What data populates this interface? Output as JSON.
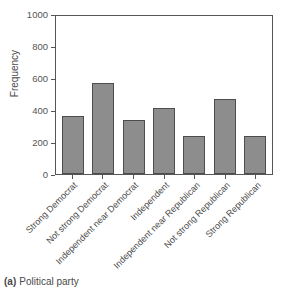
{
  "caption": {
    "tag": "(a)",
    "text": "Political party"
  },
  "chart_data": {
    "type": "bar",
    "title": "",
    "subtitle": "",
    "xlabel": "",
    "ylabel": "Frequency",
    "ylim": [
      0,
      1000
    ],
    "yticks": [
      0,
      200,
      400,
      600,
      800,
      1000
    ],
    "ytick_labels": [
      "0",
      "200",
      "400",
      "600",
      "800",
      "1000"
    ],
    "grid": false,
    "legend": false,
    "legend_position": "none",
    "bar_color": "#8d8d8d",
    "bar_edge_color": "#4d4d4d",
    "axis_color": "#555555",
    "categories": [
      "Strong Democrat",
      "Not strong Democrat",
      "Independent near Democrat",
      "Independent",
      "Independent near Republican",
      "Not strong Republican",
      "Strong Republican"
    ],
    "values": [
      360,
      570,
      340,
      410,
      235,
      470,
      235
    ]
  }
}
